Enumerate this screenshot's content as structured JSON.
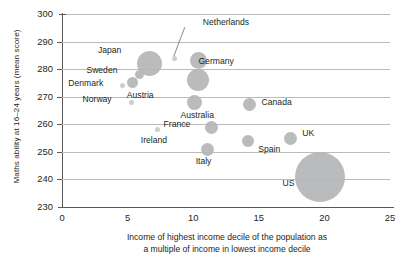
{
  "chart_data": {
    "type": "scatter",
    "title": "",
    "subtitle": "",
    "xlabel_line1": "Income of highest income decile of the population as",
    "xlabel_line2": "a multiple of income in lowest income decile",
    "ylabel": "Maths ability at 16–24 years (mean score)",
    "xlim": [
      0,
      25
    ],
    "ylim": [
      230,
      300
    ],
    "xticks": [
      "0",
      "5",
      "10",
      "15",
      "20",
      "25"
    ],
    "yticks": [
      "300",
      "290",
      "280",
      "270",
      "260",
      "250",
      "240",
      "230"
    ],
    "grid": "horizontal",
    "legend": "none",
    "bubble_encoding": "bubble area varies by country (population/sample size)",
    "marker_color": "#b4b5b6",
    "points": [
      {
        "label": "Netherlands",
        "x": 8.6,
        "y": 284,
        "size": 5,
        "label_dx": 28,
        "label_dy": -36,
        "leader": true
      },
      {
        "label": "Japan",
        "x": 6.7,
        "y": 282,
        "size": 25,
        "label_dx": -52,
        "label_dy": -14,
        "leader": false
      },
      {
        "label": "Sweden",
        "x": 5.9,
        "y": 278,
        "size": 9,
        "label_dx": -53,
        "label_dy": -5,
        "leader": false
      },
      {
        "label": "Denmark",
        "x": 4.6,
        "y": 274,
        "size": 5,
        "label_dx": -54,
        "label_dy": -3,
        "leader": false
      },
      {
        "label": "Austria",
        "x": 5.4,
        "y": 275,
        "size": 11,
        "label_dx": -6,
        "label_dy": 12,
        "leader": false
      },
      {
        "label": "Norway",
        "x": 5.3,
        "y": 268,
        "size": 5,
        "label_dx": -49,
        "label_dy": -3,
        "leader": false
      },
      {
        "label": "Germany",
        "x": 10.4,
        "y": 283,
        "size": 17,
        "label_dx": 0,
        "label_dy": 0,
        "leader": false
      },
      {
        "label": "Germany2",
        "x": 10.4,
        "y": 276,
        "size": 22,
        "label_dx": 26,
        "label_dy": 0,
        "leader": false
      },
      {
        "label": "Australia",
        "x": 10.1,
        "y": 268,
        "size": 15,
        "label_dx": -14,
        "label_dy": 13,
        "leader": false
      },
      {
        "label": "Canada",
        "x": 14.3,
        "y": 267,
        "size": 13,
        "label_dx": 12,
        "label_dy": -3,
        "leader": false
      },
      {
        "label": "France",
        "x": 11.4,
        "y": 259,
        "size": 13,
        "label_dx": -48,
        "label_dy": -3,
        "leader": false
      },
      {
        "label": "Ireland",
        "x": 7.3,
        "y": 258,
        "size": 5,
        "label_dx": -17,
        "label_dy": 10,
        "leader": false
      },
      {
        "label": "Italy",
        "x": 11.1,
        "y": 251,
        "size": 13,
        "label_dx": -12,
        "label_dy": 12,
        "leader": false
      },
      {
        "label": "Spain",
        "x": 14.2,
        "y": 254,
        "size": 12,
        "label_dx": 10,
        "label_dy": 8,
        "leader": false
      },
      {
        "label": "UK",
        "x": 17.4,
        "y": 255,
        "size": 13,
        "label_dx": 12,
        "label_dy": -5,
        "leader": false
      },
      {
        "label": "US",
        "x": 19.7,
        "y": 241,
        "size": 50,
        "label_dx": -38,
        "label_dy": 6,
        "leader": false
      }
    ]
  },
  "axis": {
    "y_title": "Maths ability at 16–24 years (mean score)",
    "x_title_line1": "Income of highest income decile of the population as",
    "x_title_line2": "a multiple of income in lowest income decile"
  },
  "labels": {
    "netherlands": "Netherlands",
    "japan": "Japan",
    "sweden": "Sweden",
    "denmark": "Denmark",
    "austria": "Austria",
    "norway": "Norway",
    "germany": "Germany",
    "australia": "Australia",
    "canada": "Canada",
    "france": "France",
    "ireland": "Ireland",
    "italy": "Italy",
    "spain": "Spain",
    "uk": "UK",
    "us": "US"
  }
}
